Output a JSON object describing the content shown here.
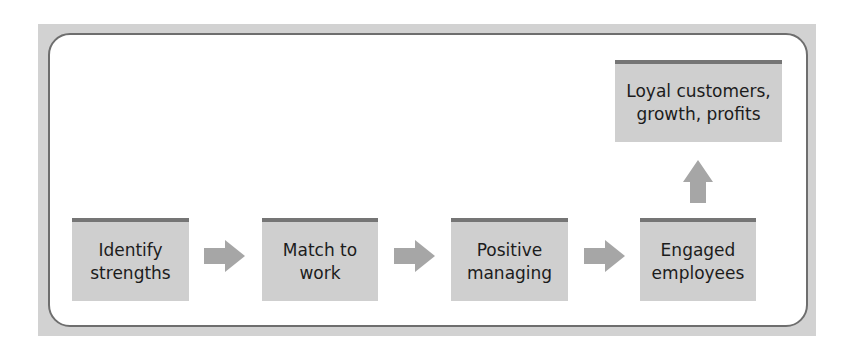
{
  "diagram": {
    "steps": [
      {
        "label": "Identify\nstrengths"
      },
      {
        "label": "Match to\nwork"
      },
      {
        "label": "Positive\nmanaging"
      },
      {
        "label": "Engaged\nemployees"
      }
    ],
    "outcome": {
      "label": "Loyal customers,\ngrowth, profits"
    },
    "arrows": [
      "arrow-right-icon",
      "arrow-right-icon",
      "arrow-right-icon",
      "arrow-up-icon"
    ],
    "colors": {
      "box_fill": "#cfcfcf",
      "box_top_bar": "#757575",
      "arrow": "#a6a6a6",
      "frame": "#d2d2d2",
      "border": "#6e6e6e",
      "text": "#1c1c1c"
    }
  }
}
